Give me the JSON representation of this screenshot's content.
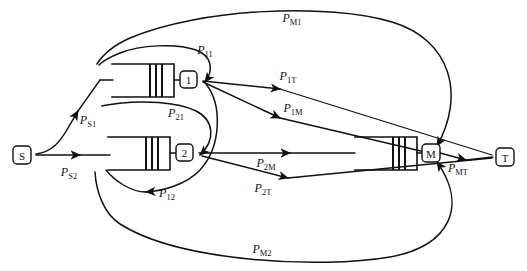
{
  "diagram": {
    "background_color": "#ffffff",
    "line_color": "#111111",
    "nodes": [
      {
        "id": "S",
        "label": "S",
        "name": "source-node",
        "shape": "rounded-square",
        "x": 22,
        "y": 155
      },
      {
        "id": "1",
        "label": "1",
        "name": "station-1-node",
        "shape": "rounded-square",
        "x": 188,
        "y": 79
      },
      {
        "id": "2",
        "label": "2",
        "name": "station-2-node",
        "shape": "rounded-square",
        "x": 184,
        "y": 152
      },
      {
        "id": "M",
        "label": "M",
        "name": "station-m-node",
        "shape": "rounded-square",
        "x": 430,
        "y": 152
      },
      {
        "id": "T",
        "label": "T",
        "name": "sink-node",
        "shape": "rounded-square",
        "x": 505,
        "y": 156
      }
    ],
    "queues": [
      {
        "id": "q1",
        "name": "queue-station-1",
        "x": 112,
        "y": 64,
        "width": 62,
        "height": 33,
        "server_bars": 3
      },
      {
        "id": "q2",
        "name": "queue-station-2",
        "x": 108,
        "y": 137,
        "width": 62,
        "height": 33,
        "server_bars": 3
      },
      {
        "id": "qm",
        "name": "queue-station-m",
        "x": 355,
        "y": 137,
        "width": 62,
        "height": 33,
        "server_bars": 3
      }
    ],
    "edge_labels": [
      {
        "id": "PS1",
        "base": "P",
        "sub": "S1",
        "name": "edge-label-p-s1",
        "x": 88,
        "y": 124
      },
      {
        "id": "PS2",
        "base": "P",
        "sub": "S2",
        "name": "edge-label-p-s2",
        "x": 69,
        "y": 176
      },
      {
        "id": "P11",
        "base": "P",
        "sub": "11",
        "name": "edge-label-p-11",
        "x": 205,
        "y": 54
      },
      {
        "id": "P21",
        "base": "P",
        "sub": "21",
        "name": "edge-label-p-21",
        "x": 176,
        "y": 117
      },
      {
        "id": "P12",
        "base": "P",
        "sub": "12",
        "name": "edge-label-p-12",
        "x": 167,
        "y": 197
      },
      {
        "id": "P1T",
        "base": "P",
        "sub": "1T",
        "name": "edge-label-p-1t",
        "x": 288,
        "y": 80
      },
      {
        "id": "P1M",
        "base": "P",
        "sub": "1M",
        "name": "edge-label-p-1m",
        "x": 293,
        "y": 112
      },
      {
        "id": "P2M",
        "base": "P",
        "sub": "2M",
        "name": "edge-label-p-2m",
        "x": 266,
        "y": 156
      },
      {
        "id": "P2T",
        "base": "P",
        "sub": "2T",
        "name": "edge-label-p-2t",
        "x": 263,
        "y": 187
      },
      {
        "id": "PMT",
        "base": "P",
        "sub": "MT",
        "name": "edge-label-p-mt",
        "x": 458,
        "y": 167
      },
      {
        "id": "PM1",
        "base": "P",
        "sub": "M1",
        "name": "edge-label-p-m1",
        "x": 292,
        "y": 18
      },
      {
        "id": "PM2",
        "base": "P",
        "sub": "M2",
        "name": "edge-label-p-m2",
        "x": 262,
        "y": 249
      }
    ],
    "edges": [
      {
        "id": "S-1",
        "name": "edge-source-to-station-1",
        "from": "S",
        "to": "1",
        "label": "PS1"
      },
      {
        "id": "S-2",
        "name": "edge-source-to-station-2",
        "from": "S",
        "to": "2",
        "label": "PS2"
      },
      {
        "id": "1-1",
        "name": "edge-station-1-feedback",
        "from": "1",
        "to": "1",
        "label": "P11"
      },
      {
        "id": "2-1",
        "name": "edge-station-2-to-station-1",
        "from": "2",
        "to": "1",
        "label": "P21"
      },
      {
        "id": "1-2",
        "name": "edge-station-1-to-station-2",
        "from": "1",
        "to": "2",
        "label": "P12"
      },
      {
        "id": "1-T",
        "name": "edge-station-1-to-sink",
        "from": "1",
        "to": "T",
        "label": "P1T"
      },
      {
        "id": "1-M",
        "name": "edge-station-1-to-station-m",
        "from": "1",
        "to": "M",
        "label": "P1M"
      },
      {
        "id": "2-M",
        "name": "edge-station-2-to-station-m",
        "from": "2",
        "to": "M",
        "label": "P2M"
      },
      {
        "id": "2-T",
        "name": "edge-station-2-to-sink",
        "from": "2",
        "to": "T",
        "label": "P2T"
      },
      {
        "id": "M-T",
        "name": "edge-station-m-to-sink",
        "from": "M",
        "to": "T",
        "label": "PMT"
      },
      {
        "id": "M-1",
        "name": "edge-station-m-to-station-1",
        "from": "M",
        "to": "1",
        "label": "PM1"
      },
      {
        "id": "M-2",
        "name": "edge-station-m-to-station-2",
        "from": "M",
        "to": "2",
        "label": "PM2"
      }
    ]
  }
}
